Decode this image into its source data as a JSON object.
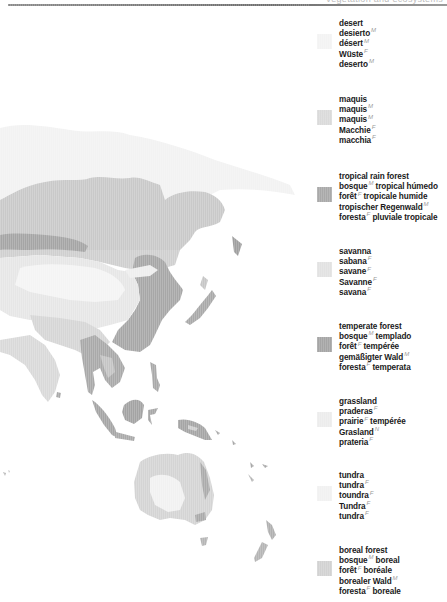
{
  "header": {
    "title": "Vegetation and ecosystems"
  },
  "colors": {
    "desert": "#f3f3f3",
    "maquis": "#dadada",
    "tropical_rain_forest": "#a9a9a9",
    "savanna": "#e2e2e2",
    "temperate_forest": "#a5a5a5",
    "grassland": "#ececec",
    "tundra": "#f1f1f1",
    "boreal_forest": "#d2d2d2",
    "ink": "#1a1a1a",
    "gender_mark": "#9a9a9a"
  },
  "legend": [
    {
      "key": "desert",
      "terms": [
        {
          "word": "desert",
          "gender": ""
        },
        {
          "word": "desierto",
          "gender": "M"
        },
        {
          "word": "désert",
          "gender": "M"
        },
        {
          "word": "Wüste",
          "gender": "F"
        },
        {
          "word": "deserto",
          "gender": "M"
        }
      ]
    },
    {
      "key": "maquis",
      "terms": [
        {
          "word": "maquis",
          "gender": ""
        },
        {
          "word": "maquis",
          "gender": "M"
        },
        {
          "word": "maquis",
          "gender": "M"
        },
        {
          "word": "Macchie",
          "gender": "F"
        },
        {
          "word": "macchia",
          "gender": "F"
        }
      ]
    },
    {
      "key": "tropical_rain_forest",
      "terms": [
        {
          "word": "tropical rain forest",
          "gender": ""
        },
        {
          "word": "bosque",
          "gender": "M",
          "rest": "tropical húmedo"
        },
        {
          "word": "forêt",
          "gender": "F",
          "rest": "tropicale humide"
        },
        {
          "word": "tropischer Regenwald",
          "gender": "M"
        },
        {
          "word": "foresta",
          "gender": "F",
          "rest": "pluviale tropicale"
        }
      ]
    },
    {
      "key": "savanna",
      "terms": [
        {
          "word": "savanna",
          "gender": ""
        },
        {
          "word": "sabana",
          "gender": "F"
        },
        {
          "word": "savane",
          "gender": "F"
        },
        {
          "word": "Savanne",
          "gender": "F"
        },
        {
          "word": "savana",
          "gender": "F"
        }
      ]
    },
    {
      "key": "temperate_forest",
      "terms": [
        {
          "word": "temperate forest",
          "gender": ""
        },
        {
          "word": "bosque",
          "gender": "M",
          "rest": "templado"
        },
        {
          "word": "forêt",
          "gender": "F",
          "rest": "tempérée"
        },
        {
          "word": "gemäßigter Wald",
          "gender": "M"
        },
        {
          "word": "foresta",
          "gender": "F",
          "rest": "temperata"
        }
      ]
    },
    {
      "key": "grassland",
      "terms": [
        {
          "word": "grassland",
          "gender": ""
        },
        {
          "word": "praderas",
          "gender": "F"
        },
        {
          "word": "prairie",
          "gender": "F",
          "rest": "tempérée"
        },
        {
          "word": "Grasland",
          "gender": "N"
        },
        {
          "word": "prateria",
          "gender": "F"
        }
      ]
    },
    {
      "key": "tundra",
      "terms": [
        {
          "word": "tundra",
          "gender": ""
        },
        {
          "word": "tundra",
          "gender": "F"
        },
        {
          "word": "toundra",
          "gender": "F"
        },
        {
          "word": "Tundra",
          "gender": "F"
        },
        {
          "word": "tundra",
          "gender": "F"
        }
      ]
    },
    {
      "key": "boreal_forest",
      "terms": [
        {
          "word": "boreal forest",
          "gender": ""
        },
        {
          "word": "bosque",
          "gender": "M",
          "rest": "boreal"
        },
        {
          "word": "forêt",
          "gender": "F",
          "rest": "boréale"
        },
        {
          "word": "borealer Wald",
          "gender": "M"
        },
        {
          "word": "foresta",
          "gender": "F",
          "rest": "boreale"
        }
      ]
    }
  ],
  "map": {
    "region": "Asia and Oceania",
    "description": "Grayscale vegetation map of East Asia, Southeast Asia, Australia and New Zealand"
  }
}
